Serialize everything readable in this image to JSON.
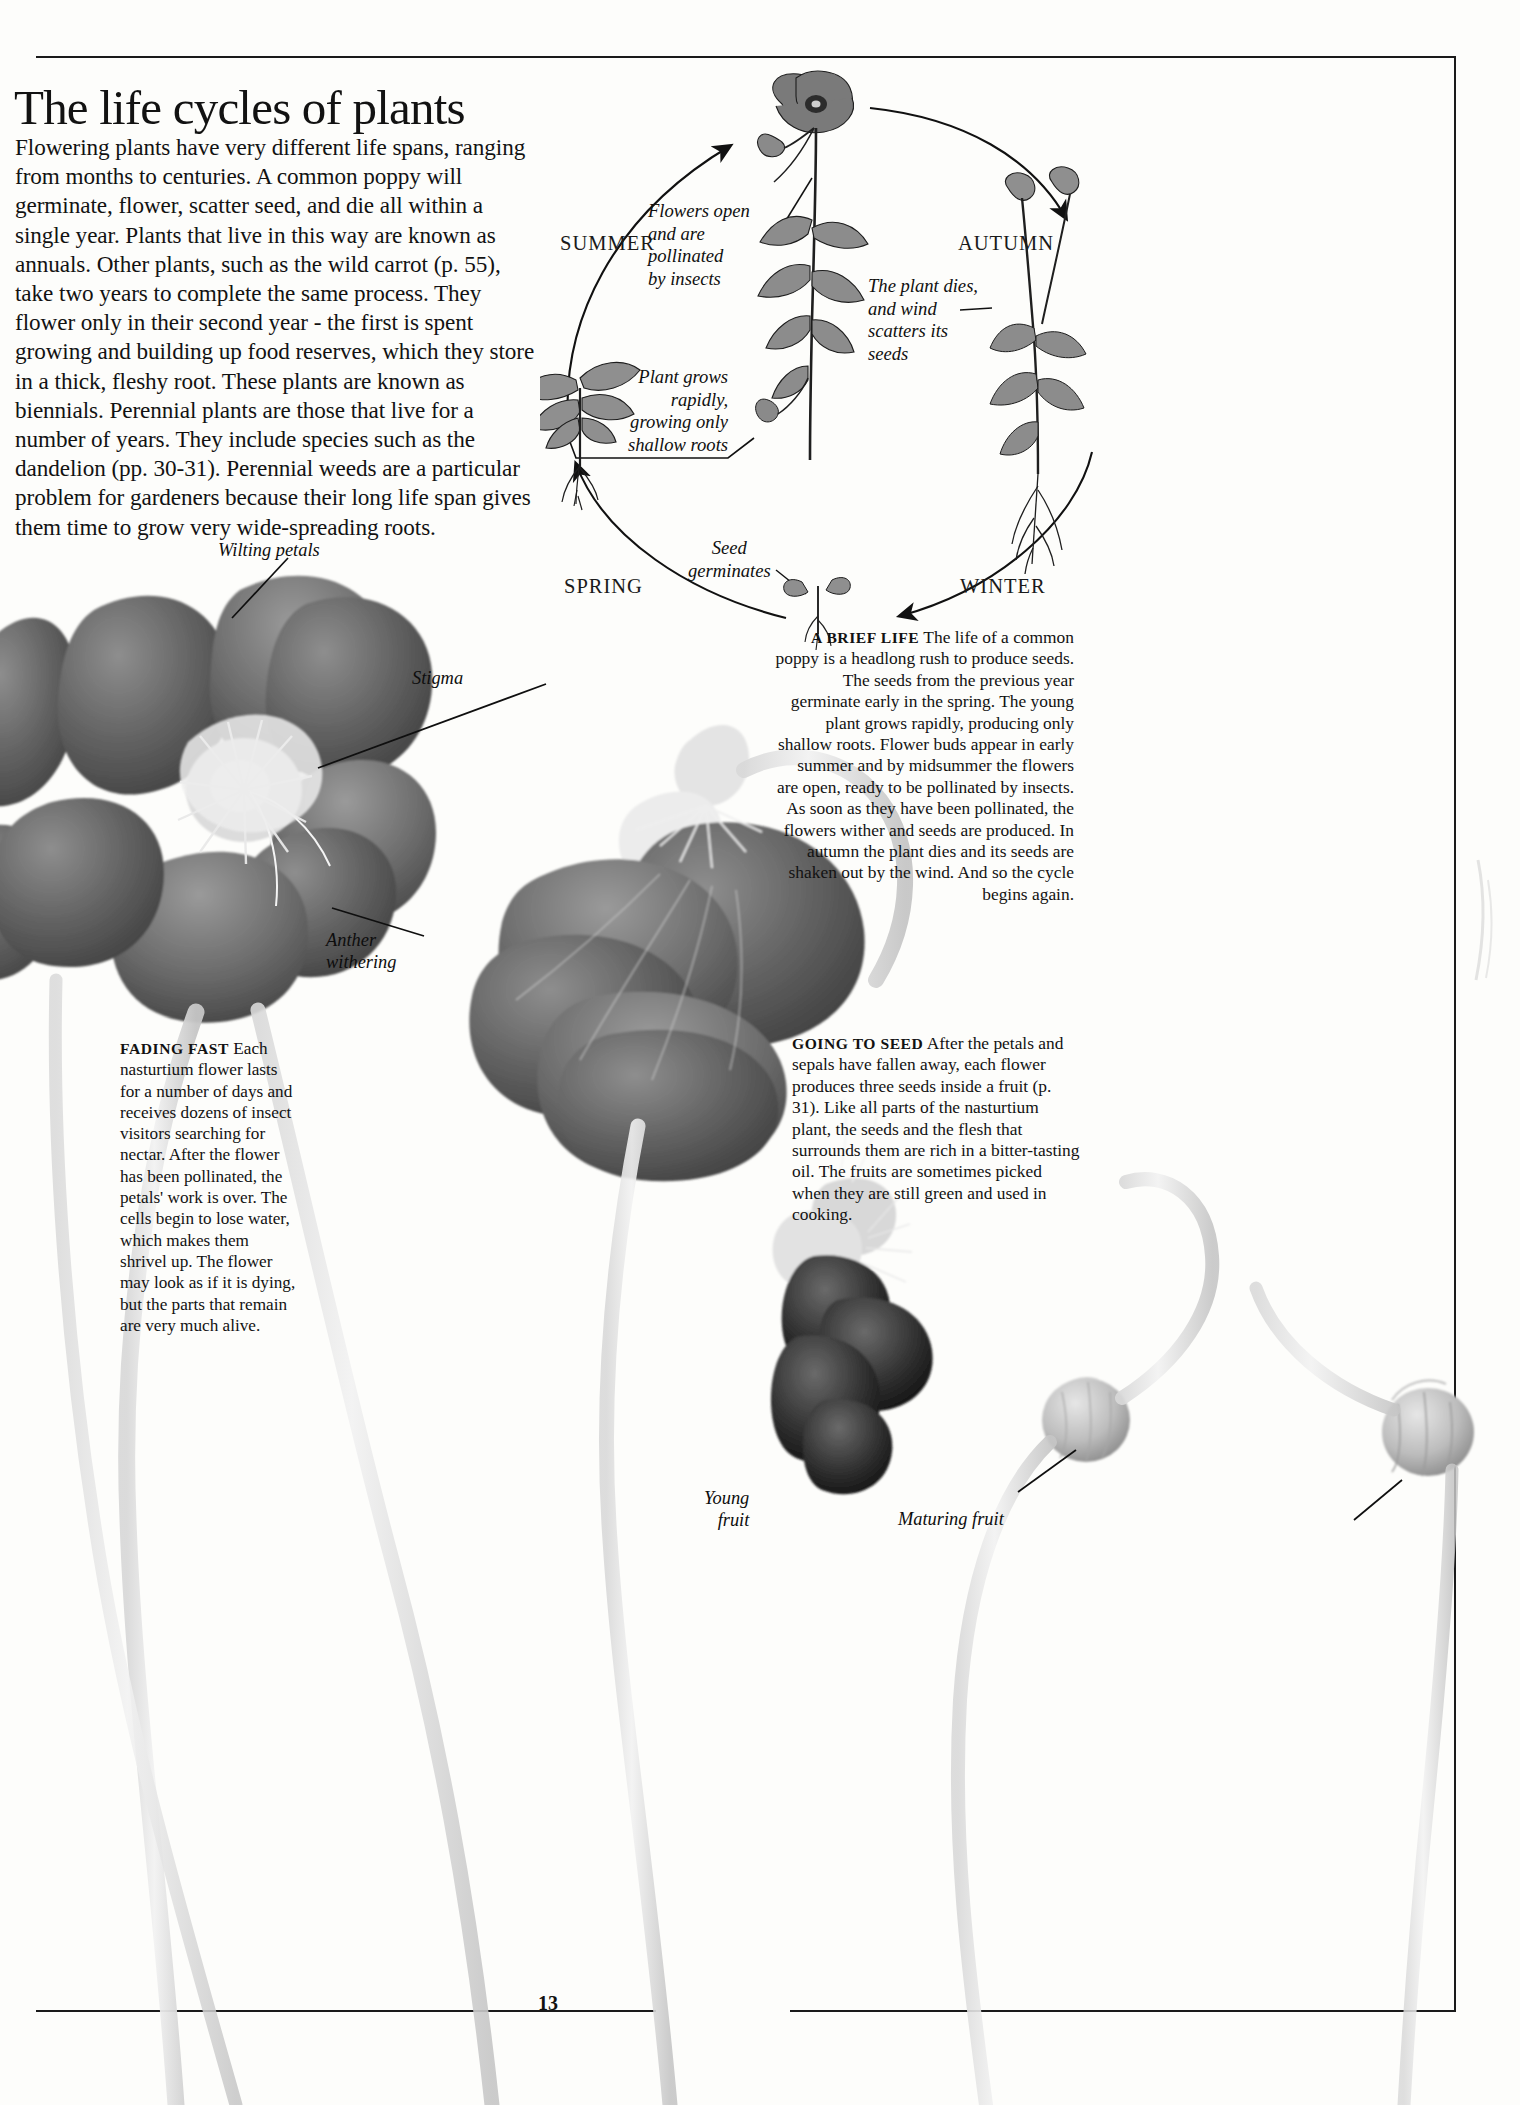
{
  "page": {
    "folio": "13",
    "headline": "The life cycles of plants",
    "intro": "Flowering plants have very different life spans, ranging from months to centuries. A common poppy will germinate, flower, scatter seed, and die all within a single year. Plants that live in this way are known as annuals. Other plants, such as the wild carrot (p. 55), take two years to complete the same process. They flower only in their second year - the first is spent growing and building up food reserves, which they store in a thick, fleshy root. These plants are known as biennials. Perennial plants are those that live for a number of years. They include species such as the dandelion (pp. 30-31). Perennial weeds are a particular problem for gardeners because their long life span gives them time to grow very wide-spreading roots."
  },
  "cycle_diagram": {
    "seasons": {
      "summer": "SUMMER",
      "autumn": "AUTUMN",
      "spring": "SPRING",
      "winter": "WINTER"
    },
    "labels": {
      "flowers_open": "Flowers open\nand are\npollinated\nby insects",
      "plant_dies": "The plant dies,\nand wind\nscatters its\nseeds",
      "plant_grows": "Plant grows\nrapidly,\ngrowing only\nshallow roots",
      "seed_germinates": "Seed\ngerminates"
    },
    "stages": [
      "seedling",
      "young plant with shallow roots",
      "flowering poppy",
      "dead poppy scattering seeds"
    ]
  },
  "captions": {
    "brief_life": {
      "title": "A BRIEF LIFE",
      "body": "The life of a common poppy is a headlong rush to produce seeds. The seeds from the previous year germinate early in the spring. The young plant grows rapidly, producing only shallow roots. Flower buds appear in early summer and by midsummer the flowers are open, ready to be pollinated by insects. As soon as they have been pollinated, the flowers wither and seeds are produced. In autumn the plant dies and its seeds are shaken out by the wind. And so the cycle begins again."
    },
    "fading_fast": {
      "title": "FADING FAST",
      "body": "Each nasturtium flower lasts for a number of days and receives dozens of insect visitors searching for nectar. After the flower has been pollinated, the petals' work is over. The cells begin to lose water, which makes them shrivel up. The flower may look as if it is dying, but the parts that remain are very much alive."
    },
    "going_to_seed": {
      "title": "GOING TO SEED",
      "body": "After the petals and sepals have fallen away, each flower produces three seeds inside a fruit (p. 31). Like all parts of the nasturtium plant, the seeds and the flesh that surrounds them are rich in a bitter-tasting oil. The fruits are sometimes picked when they are still green and used in cooking."
    }
  },
  "photo_labels": {
    "wilting_petals": "Wilting petals",
    "stigma": "Stigma",
    "anther_withering": "Anther\nwithering",
    "young_fruit": "Young\nfruit",
    "maturing_fruit": "Maturing fruit"
  },
  "colors": {
    "ink": "#121212",
    "paper": "#fdfdfb",
    "rule": "#1a1a1a"
  }
}
